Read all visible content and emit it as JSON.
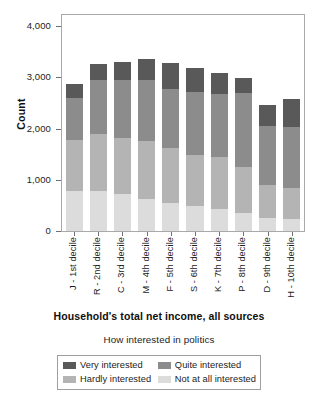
{
  "chart_data": {
    "type": "bar",
    "subtype": "stacked-vertical",
    "title": "",
    "xlabel": "Household's total net income, all sources",
    "ylabel": "Count",
    "ylim": [
      0,
      4200
    ],
    "yticks": [
      0,
      1000,
      2000,
      3000,
      4000
    ],
    "ytick_labels": [
      "0",
      "1,000",
      "2,000",
      "3,000",
      "4,000"
    ],
    "grid": false,
    "legend_title": "How interested in politics",
    "legend_position": "bottom",
    "stack_order_bottom_to_top": [
      "Not at all interested",
      "Hardly interested",
      "Quite interested",
      "Very interested"
    ],
    "categories": [
      "J - 1st decile",
      "R - 2nd decile",
      "C - 3rd decile",
      "M - 4th decile",
      "F - 5th decile",
      "S - 6th decile",
      "K - 7th decile",
      "P - 8th decile",
      "D - 9th decile",
      "H - 10th decile"
    ],
    "series": [
      {
        "name": "Not at all interested",
        "color": "#dcdcdc",
        "values": [
          820,
          820,
          760,
          650,
          580,
          500,
          440,
          370,
          270,
          250
        ]
      },
      {
        "name": "Hardly interested",
        "color": "#b4b4b4",
        "values": [
          1030,
          1160,
          1130,
          1180,
          1120,
          1060,
          1060,
          930,
          660,
          630
        ]
      },
      {
        "name": "Quite interested",
        "color": "#8c8c8c",
        "values": [
          870,
          1090,
          1190,
          1250,
          1190,
          1280,
          1290,
          1520,
          1210,
          1240
        ]
      },
      {
        "name": "Very interested",
        "color": "#595959",
        "values": [
          280,
          340,
          370,
          430,
          540,
          490,
          440,
          310,
          430,
          580
        ]
      }
    ],
    "totals": [
      3000,
      3410,
      3450,
      3510,
      3430,
      3330,
      3230,
      3130,
      2570,
      2700
    ]
  },
  "axes": {
    "y_title": "Count",
    "x_title": "Household's total net income, all sources",
    "y_tick_labels": [
      "4,000",
      "3,000",
      "2,000",
      "1,000",
      "0"
    ]
  },
  "legend": {
    "title": "How interested in politics",
    "items": [
      {
        "label": "Very interested",
        "color": "#595959"
      },
      {
        "label": "Quite interested",
        "color": "#8c8c8c"
      },
      {
        "label": "Hardly interested",
        "color": "#b4b4b4"
      },
      {
        "label": "Not at all interested",
        "color": "#dcdcdc"
      }
    ]
  },
  "style": {
    "frame_color": "#a9a9ad",
    "tick_color": "#6f6f74",
    "text_color": "#1c1c1c",
    "background": "#ffffff"
  }
}
